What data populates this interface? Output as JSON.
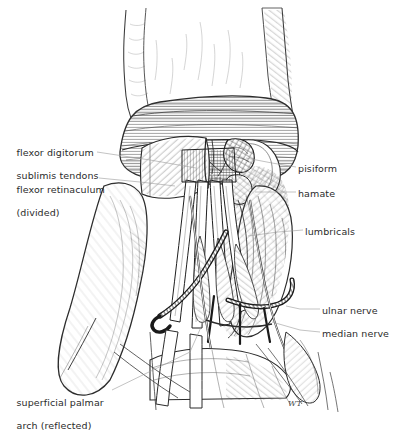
{
  "figure": {
    "medium": "pen-and-ink line drawing with cross-hatching",
    "background_color": "#ffffff",
    "ink_color": "#2b2b2b",
    "leader_color": "#9a9a9a",
    "signature": "WT"
  },
  "labels": [
    {
      "id": "flexor-digitorum-sublimis-tendons",
      "lines": [
        "flexor digitorum",
        "sublimis tendons"
      ],
      "text": "flexor digitorum sublimis tendons",
      "side": "left",
      "x": 4,
      "y": 135
    },
    {
      "id": "flexor-retinaculum-divided",
      "lines": [
        "flexor retinaculum",
        "(divided)"
      ],
      "text": "flexor retinaculum (divided)",
      "side": "left",
      "x": 4,
      "y": 172
    },
    {
      "id": "superficial-palmar-arch-reflected",
      "lines": [
        "superficial palmar",
        "arch (reflected)"
      ],
      "text": "superficial palmar arch (reflected)",
      "side": "left",
      "x": 4,
      "y": 385
    },
    {
      "id": "pisiform",
      "lines": [
        "pisiform"
      ],
      "text": "pisiform",
      "side": "right",
      "x": 298,
      "y": 163
    },
    {
      "id": "hamate",
      "lines": [
        "hamate"
      ],
      "text": "hamate",
      "side": "right",
      "x": 298,
      "y": 188
    },
    {
      "id": "lumbricals",
      "lines": [
        "lumbricals"
      ],
      "text": "lumbricals",
      "side": "right",
      "x": 305,
      "y": 226
    },
    {
      "id": "ulnar-nerve",
      "lines": [
        "ulnar nerve"
      ],
      "text": "ulnar nerve",
      "side": "right",
      "x": 322,
      "y": 305
    },
    {
      "id": "median-nerve",
      "lines": [
        "median nerve"
      ],
      "text": "median nerve",
      "side": "right",
      "x": 322,
      "y": 328
    }
  ],
  "leaders": [
    {
      "id": "leader-flexor-digitorum",
      "points": "97,152 150,160 196,168"
    },
    {
      "id": "leader-flexor-retinaculum",
      "points": "99,178 140,182 175,186"
    },
    {
      "id": "leader-superficial-arch",
      "points": "112,390 190,352 205,318"
    },
    {
      "id": "leader-pisiform",
      "points": "296,167 272,163 246,158"
    },
    {
      "id": "leader-hamate",
      "points": "296,192 274,192 255,192"
    },
    {
      "id": "leader-lumbricals",
      "points": "303,230 278,232 248,236"
    },
    {
      "id": "leader-ulnar-nerve",
      "points": "320,309 300,309 286,306"
    },
    {
      "id": "leader-median-nerve",
      "points": "320,332 300,330 272,322"
    }
  ],
  "signature": {
    "text": "WT",
    "x": 288,
    "y": 399
  }
}
